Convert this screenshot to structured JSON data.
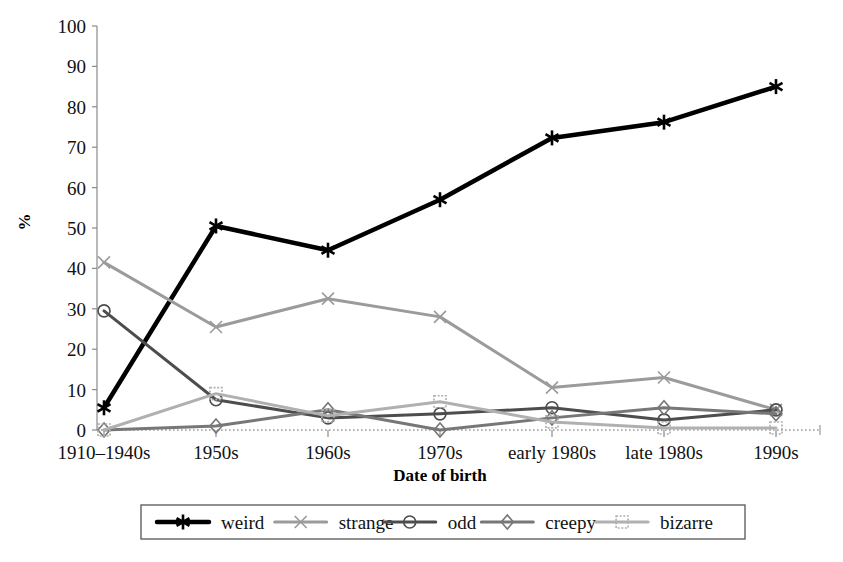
{
  "chart_data": {
    "type": "line",
    "title": "",
    "xlabel": "Date of birth",
    "ylabel": "%",
    "ylim": [
      0,
      100
    ],
    "ytick_step": 10,
    "grid": false,
    "legend_position": "bottom",
    "categories": [
      "1910–1940s",
      "1950s",
      "1960s",
      "1970s",
      "early 1980s",
      "late 1980s",
      "1990s"
    ],
    "yticks": [
      "0",
      "10",
      "20",
      "30",
      "40",
      "50",
      "60",
      "70",
      "80",
      "90",
      "100"
    ],
    "series": [
      {
        "name": "weird",
        "color": "#000000",
        "marker": "asterisk",
        "width": 4.5,
        "values": [
          5.5,
          50.5,
          44.5,
          57,
          72.3,
          76.2,
          85
        ]
      },
      {
        "name": "strange",
        "color": "#9b9b9b",
        "marker": "x",
        "width": 3,
        "values": [
          41.5,
          25.5,
          32.5,
          28,
          10.5,
          13,
          5
        ]
      },
      {
        "name": "odd",
        "color": "#4d4d4d",
        "marker": "circle",
        "width": 3,
        "values": [
          29.5,
          7.5,
          3,
          4,
          5.5,
          2.5,
          5
        ]
      },
      {
        "name": "creepy",
        "color": "#777777",
        "marker": "diamond",
        "width": 3,
        "values": [
          0,
          1,
          5,
          0,
          3,
          5.5,
          4
        ]
      },
      {
        "name": "bizarre",
        "color": "#b0b0b0",
        "marker": "square",
        "width": 3,
        "values": [
          0,
          9,
          3.5,
          7,
          2,
          0.5,
          0.5
        ]
      }
    ]
  },
  "legend": {
    "items": [
      {
        "label": "weird"
      },
      {
        "label": "strange"
      },
      {
        "label": "odd"
      },
      {
        "label": "creepy"
      },
      {
        "label": "bizarre"
      }
    ]
  },
  "axes": {
    "y_title": "%",
    "x_title": "Date of birth"
  }
}
